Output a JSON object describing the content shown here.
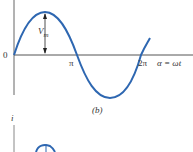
{
  "figure": {
    "caption": "(b)",
    "origin_label": "0",
    "pi_label": "π",
    "two_pi_label": "2π",
    "axis_label": "α = ωt",
    "amplitude_label": "V",
    "amplitude_sub": "m",
    "lower_axis_label": "i"
  },
  "colors": {
    "curve": "#2e67b1",
    "axis": "#555555"
  }
}
